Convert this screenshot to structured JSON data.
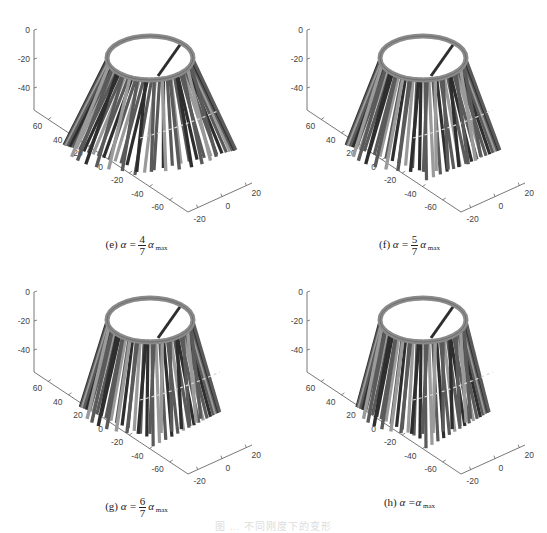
{
  "figure": {
    "caption_partial": "图 ... 不同刚度下的变形",
    "panels": [
      {
        "id": "e",
        "label": "(e)",
        "alpha_prefix": "α =",
        "frac_num": "4",
        "frac_den": "7",
        "alpha_suffix": "α",
        "sub": "max",
        "spread": 0.55,
        "offset": [
          0,
          0
        ]
      },
      {
        "id": "f",
        "label": "(f)",
        "alpha_prefix": "α =",
        "frac_num": "5",
        "frac_den": "7",
        "alpha_suffix": "α",
        "sub": "max",
        "spread": 0.4,
        "offset": [
          273,
          0
        ]
      },
      {
        "id": "g",
        "label": "(g)",
        "alpha_prefix": "α =",
        "frac_num": "6",
        "frac_den": "7",
        "alpha_suffix": "α",
        "sub": "max",
        "spread": 0.28,
        "offset": [
          0,
          262
        ]
      },
      {
        "id": "h",
        "label": "(h)",
        "alpha_prefix": "α =α",
        "frac_num": "",
        "frac_den": "",
        "alpha_suffix": "",
        "sub": "max",
        "spread": 0.22,
        "offset": [
          273,
          262
        ]
      }
    ]
  },
  "chart_data": [
    {
      "type": "3d-surface",
      "title": "(e) α = 4/7 α_max",
      "zticks": [
        "0",
        "-20",
        "-40"
      ],
      "yticks": [
        "60",
        "40",
        "20",
        "0",
        "-20",
        "-40",
        "-60"
      ],
      "xticks": [
        "-20",
        "0",
        "20"
      ],
      "zlim": [
        -50,
        0
      ],
      "ylim": [
        -70,
        70
      ],
      "xlim": [
        -25,
        25
      ],
      "grid": false
    },
    {
      "type": "3d-surface",
      "title": "(f) α = 5/7 α_max",
      "zticks": [
        "0",
        "-20",
        "-40"
      ],
      "yticks": [
        "60",
        "40",
        "20",
        "0",
        "-20",
        "-40",
        "-60"
      ],
      "xticks": [
        "-20",
        "0",
        "20"
      ],
      "zlim": [
        -50,
        0
      ],
      "ylim": [
        -70,
        70
      ],
      "xlim": [
        -25,
        25
      ],
      "grid": false
    },
    {
      "type": "3d-surface",
      "title": "(g) α = 6/7 α_max",
      "zticks": [
        "0",
        "-20",
        "-40"
      ],
      "yticks": [
        "60",
        "40",
        "20",
        "0",
        "-20",
        "-40",
        "-60"
      ],
      "xticks": [
        "-20",
        "0",
        "20"
      ],
      "zlim": [
        -50,
        0
      ],
      "ylim": [
        -70,
        70
      ],
      "xlim": [
        -25,
        25
      ],
      "grid": false
    },
    {
      "type": "3d-surface",
      "title": "(h) α = α_max",
      "zticks": [
        "0",
        "-20",
        "-40"
      ],
      "yticks": [
        "60",
        "40",
        "20",
        "0",
        "-20",
        "-40",
        "-60"
      ],
      "xticks": [
        "-20",
        "0",
        "20"
      ],
      "zlim": [
        -50,
        0
      ],
      "ylim": [
        -70,
        70
      ],
      "xlim": [
        -25,
        25
      ],
      "grid": false
    }
  ],
  "colors": {
    "axis": "#555555",
    "ring": "#8a8a8a",
    "strip_dark": "#2e2e2e",
    "strip_mid": "#5a5a5a",
    "strip_light": "#9a9a9a"
  }
}
